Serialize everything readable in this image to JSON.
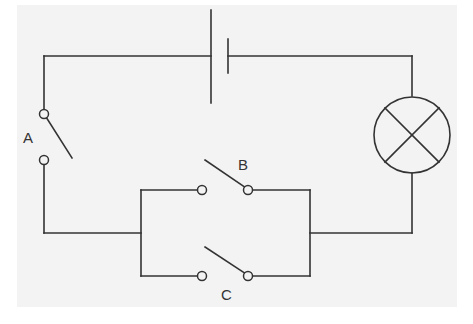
{
  "diagram": {
    "type": "circuit",
    "colors": {
      "wire": "#333333",
      "background": "#f3f3f3",
      "page": "#ffffff"
    },
    "components": {
      "battery": {
        "kind": "cell"
      },
      "lamp": {
        "kind": "lamp"
      },
      "switch_a": {
        "label": "A",
        "state": "open",
        "position": "series"
      },
      "switch_b": {
        "label": "B",
        "state": "open",
        "position": "parallel-upper"
      },
      "switch_c": {
        "label": "C",
        "state": "open",
        "position": "parallel-lower"
      }
    },
    "labels": {
      "a": "A",
      "b": "B",
      "c": "C"
    }
  }
}
